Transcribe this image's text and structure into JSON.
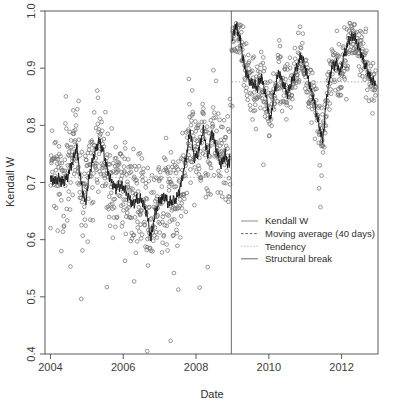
{
  "chart_data": {
    "type": "scatter",
    "title": "",
    "xlabel": "Date",
    "ylabel": "Kendall W",
    "xlim": [
      2003.85,
      2013.0
    ],
    "ylim": [
      0.4,
      1.0
    ],
    "grid": false,
    "xticks": [
      "2004",
      "2006",
      "2008",
      "2010",
      "2012"
    ],
    "xtick_values": [
      2004,
      2006,
      2008,
      2010,
      2012
    ],
    "yticks": [
      "0.4",
      "0.5",
      "0.6",
      "0.7",
      "0.8",
      "0.9",
      "1.0"
    ],
    "ytick_values": [
      0.4,
      0.5,
      0.6,
      0.7,
      0.8,
      0.9,
      1.0
    ],
    "legend_position": "center-right",
    "legend": [
      {
        "label": "Kendall W",
        "style": "solid-thin",
        "color": "#6e6e6e"
      },
      {
        "label": "Moving average (40 days)",
        "style": "dashed",
        "color": "#3a3a3a"
      },
      {
        "label": "Tendency",
        "style": "dotted",
        "color": "#9a9a9a"
      },
      {
        "label": "Structural break",
        "style": "solid",
        "color": "#5a5a5a"
      }
    ],
    "annotations": [
      {
        "name": "structural-break",
        "type": "vline",
        "x": 2008.97,
        "label": "Structural break"
      }
    ],
    "series": [
      {
        "name": "Kendall W",
        "type": "scatter",
        "marker": "open-circle",
        "color": "#6e6e6e",
        "n_points": 1180,
        "regime_1": {
          "x_range": [
            2004.0,
            2008.95
          ],
          "mean": 0.7,
          "spread": 0.075,
          "min": 0.405,
          "max": 0.915
        },
        "regime_2": {
          "x_range": [
            2008.98,
            2012.95
          ],
          "mean": 0.885,
          "spread": 0.045,
          "min": 0.655,
          "max": 0.98
        }
      },
      {
        "name": "Moving average (40 days)",
        "type": "line",
        "color": "#1a1a1a",
        "x": [
          2004.0,
          2004.12,
          2004.24,
          2004.36,
          2004.48,
          2004.6,
          2004.72,
          2004.84,
          2004.96,
          2005.08,
          2005.2,
          2005.32,
          2005.44,
          2005.56,
          2005.68,
          2005.8,
          2005.92,
          2006.04,
          2006.16,
          2006.28,
          2006.4,
          2006.52,
          2006.64,
          2006.76,
          2006.88,
          2007.0,
          2007.12,
          2007.24,
          2007.36,
          2007.48,
          2007.6,
          2007.72,
          2007.84,
          2007.96,
          2008.08,
          2008.2,
          2008.32,
          2008.44,
          2008.56,
          2008.68,
          2008.8,
          2008.92,
          2009.0,
          2009.08,
          2009.2,
          2009.32,
          2009.44,
          2009.56,
          2009.68,
          2009.8,
          2009.92,
          2010.04,
          2010.16,
          2010.28,
          2010.4,
          2010.52,
          2010.64,
          2010.76,
          2010.88,
          2011.0,
          2011.12,
          2011.24,
          2011.36,
          2011.48,
          2011.6,
          2011.72,
          2011.84,
          2011.96,
          2012.08,
          2012.2,
          2012.32,
          2012.44,
          2012.56,
          2012.68,
          2012.8,
          2012.92
        ],
        "y": [
          0.705,
          0.703,
          0.706,
          0.7,
          0.712,
          0.735,
          0.762,
          0.7,
          0.663,
          0.718,
          0.748,
          0.772,
          0.758,
          0.722,
          0.7,
          0.69,
          0.695,
          0.688,
          0.672,
          0.662,
          0.672,
          0.668,
          0.648,
          0.603,
          0.648,
          0.668,
          0.677,
          0.664,
          0.668,
          0.673,
          0.7,
          0.742,
          0.79,
          0.74,
          0.757,
          0.792,
          0.745,
          0.788,
          0.758,
          0.73,
          0.748,
          0.728,
          0.95,
          0.975,
          0.955,
          0.905,
          0.88,
          0.872,
          0.866,
          0.884,
          0.852,
          0.808,
          0.862,
          0.895,
          0.87,
          0.855,
          0.878,
          0.9,
          0.922,
          0.902,
          0.872,
          0.843,
          0.805,
          0.773,
          0.855,
          0.898,
          0.91,
          0.893,
          0.925,
          0.948,
          0.958,
          0.942,
          0.92,
          0.9,
          0.882,
          0.872
        ]
      },
      {
        "name": "Tendency",
        "type": "segments",
        "color": "#9a9a9a",
        "segments": [
          {
            "x0": 2004.0,
            "x1": 2008.95,
            "y0": 0.709,
            "y1": 0.709
          },
          {
            "x0": 2008.98,
            "x1": 2012.95,
            "y0": 0.876,
            "y1": 0.876
          }
        ]
      }
    ]
  }
}
